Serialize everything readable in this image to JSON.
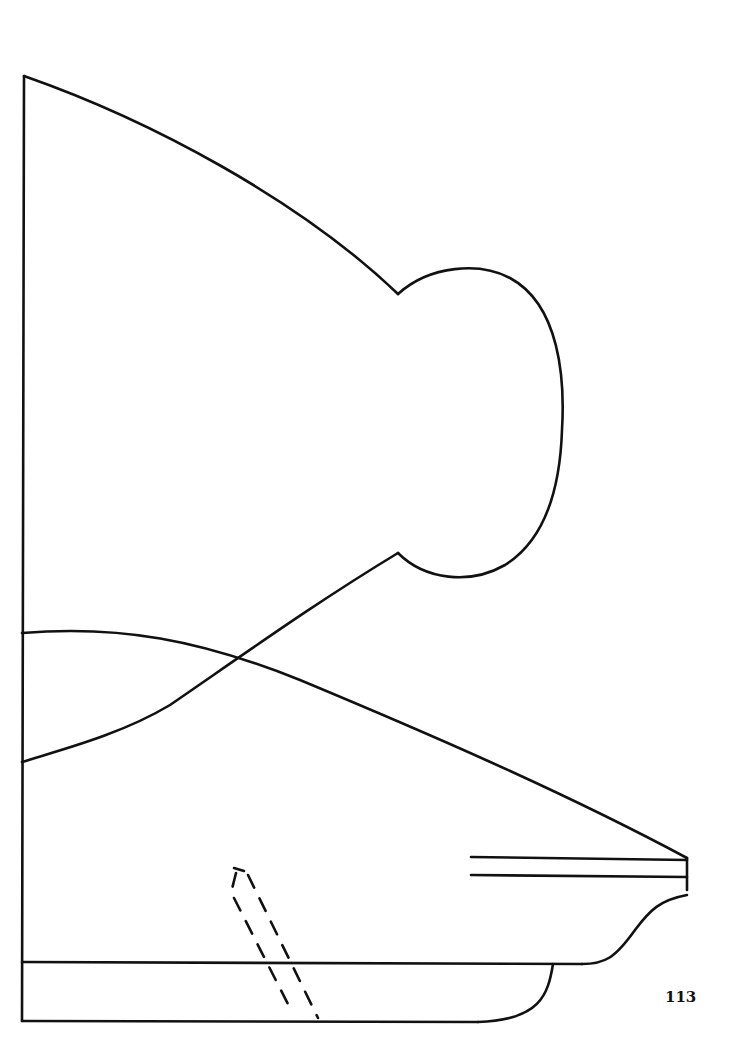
{
  "page": {
    "number": "113",
    "stroke_color": "#111111",
    "background_color": "#ffffff"
  },
  "pattern": {
    "pieces": [
      "bodice-piece-with-rounded-tab",
      "lower-skirt-piece",
      "base-band-piece"
    ],
    "markings": [
      "double-line-slot",
      "dashed-placement-guide"
    ]
  }
}
